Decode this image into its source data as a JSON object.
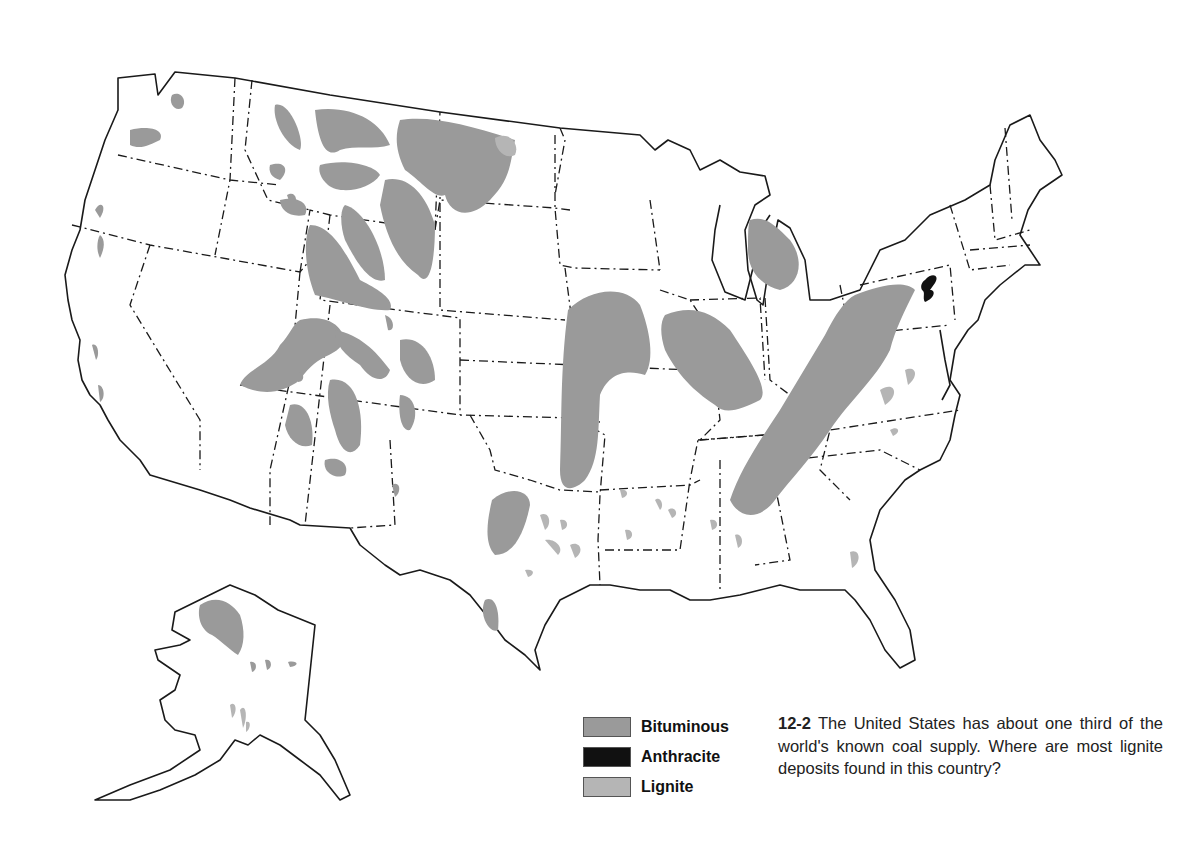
{
  "figure": {
    "number": "12-2",
    "caption": "The United States has about one third of the world's known coal supply. Where are most lignite deposits found in this country?"
  },
  "legend": {
    "items": [
      {
        "label": "Bituminous",
        "color": "#9a9a9a"
      },
      {
        "label": "Anthracite",
        "color": "#111111"
      },
      {
        "label": "Lignite",
        "color": "#b5b5b5"
      }
    ]
  },
  "map": {
    "subject": "Coal deposits of the United States",
    "regions_shown": [
      "Contiguous United States",
      "Alaska"
    ],
    "colors": {
      "bituminous": "#9a9a9a",
      "anthracite": "#111111",
      "lignite": "#b5b5b5",
      "outline": "#1a1a1a",
      "background": "#ffffff"
    }
  }
}
